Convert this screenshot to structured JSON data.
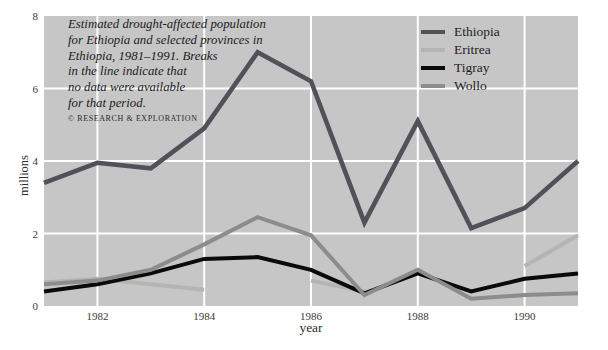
{
  "page": {
    "background": "#ffffff"
  },
  "caption": {
    "lines": [
      "Estimated drought-affected population",
      "for Ethiopia and selected provinces in",
      "Ethiopia, 1981–1991. Breaks",
      "in the line indicate that",
      "no data were available",
      "for that period."
    ],
    "credit": "© RESEARCH & EXPLORATION"
  },
  "chart_data": {
    "type": "line",
    "xlabel": "year",
    "ylabel": "millions",
    "xlim": [
      1981,
      1991
    ],
    "ylim": [
      0,
      8
    ],
    "xticks": [
      1982,
      1984,
      1986,
      1988,
      1990
    ],
    "yticks": [
      0,
      2,
      4,
      6,
      8
    ],
    "grid": "white gridlines on gray panel",
    "legend_position": "top-right",
    "plot_bg": "#c6c6c6",
    "gridline_color": "#ffffff",
    "series": [
      {
        "name": "Ethiopia",
        "color": "#51515a",
        "stroke_width": 4.6,
        "segments": [
          [
            [
              1981,
              3.4
            ],
            [
              1982,
              3.95
            ],
            [
              1983,
              3.8
            ],
            [
              1984,
              4.9
            ],
            [
              1985,
              7.0
            ],
            [
              1986,
              6.2
            ],
            [
              1987,
              2.3
            ],
            [
              1988,
              5.1
            ],
            [
              1989,
              2.15
            ],
            [
              1990,
              2.7
            ],
            [
              1991,
              4.0
            ]
          ]
        ]
      },
      {
        "name": "Eritrea",
        "color": "#b4b4b2",
        "stroke_width": 4,
        "segments": [
          [
            [
              1981,
              0.65
            ],
            [
              1982,
              0.75
            ],
            [
              1983,
              0.6
            ],
            [
              1984,
              0.45
            ]
          ],
          [
            [
              1986,
              0.7
            ],
            [
              1987,
              0.4
            ]
          ],
          [
            [
              1990,
              1.1
            ],
            [
              1991,
              1.95
            ]
          ]
        ]
      },
      {
        "name": "Tigray",
        "color": "#0a0a0a",
        "stroke_width": 4,
        "segments": [
          [
            [
              1981,
              0.4
            ],
            [
              1982,
              0.6
            ],
            [
              1983,
              0.9
            ],
            [
              1984,
              1.3
            ],
            [
              1985,
              1.35
            ],
            [
              1986,
              1.0
            ],
            [
              1987,
              0.35
            ],
            [
              1988,
              0.9
            ],
            [
              1989,
              0.4
            ],
            [
              1990,
              0.75
            ],
            [
              1991,
              0.9
            ]
          ]
        ]
      },
      {
        "name": "Wollo",
        "color": "#8c8c8a",
        "stroke_width": 4,
        "segments": [
          [
            [
              1981,
              0.6
            ],
            [
              1982,
              0.7
            ],
            [
              1983,
              1.0
            ],
            [
              1984,
              1.7
            ],
            [
              1985,
              2.45
            ],
            [
              1986,
              1.95
            ],
            [
              1987,
              0.3
            ],
            [
              1988,
              1.0
            ],
            [
              1989,
              0.2
            ],
            [
              1990,
              0.3
            ],
            [
              1991,
              0.35
            ]
          ]
        ]
      }
    ],
    "draw_order": [
      "Eritrea",
      "Tigray",
      "Wollo",
      "Ethiopia"
    ]
  }
}
